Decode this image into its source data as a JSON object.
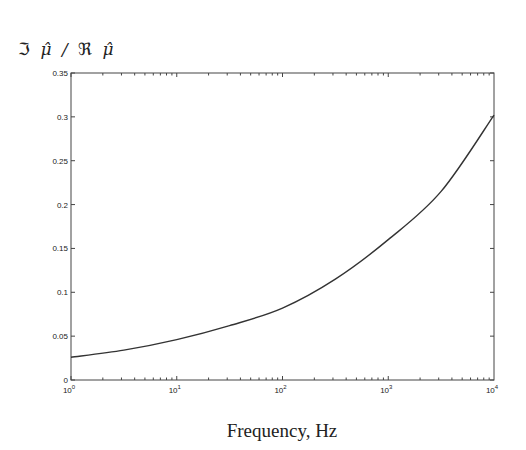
{
  "chart_data": {
    "type": "line",
    "title": "",
    "xlabel": "Frequency, Hz",
    "ylabel": "ℑ μ̂ / ℜ μ̂",
    "xscale": "log",
    "xlim": [
      1,
      10000
    ],
    "ylim": [
      0,
      0.35
    ],
    "grid": false,
    "legend": null,
    "x_ticks": [
      "10^0",
      "10^1",
      "10^2",
      "10^3",
      "10^4"
    ],
    "y_ticks": [
      "0",
      "0.05",
      "0.1",
      "0.15",
      "0.2",
      "0.25",
      "0.3",
      "0.35"
    ],
    "series": [
      {
        "name": "Im(mu)/Re(mu)",
        "x": [
          1,
          3.16,
          10,
          31.6,
          100,
          316,
          1000,
          3162,
          10000
        ],
        "values": [
          0.026,
          0.034,
          0.046,
          0.062,
          0.082,
          0.115,
          0.16,
          0.215,
          0.302
        ]
      }
    ]
  },
  "labels": {
    "ylabel_im": "ℑ",
    "ylabel_mu1": "μ̂",
    "ylabel_slash": "/",
    "ylabel_re": "ℜ",
    "ylabel_mu2": "μ̂",
    "xlabel": "Frequency, Hz"
  }
}
